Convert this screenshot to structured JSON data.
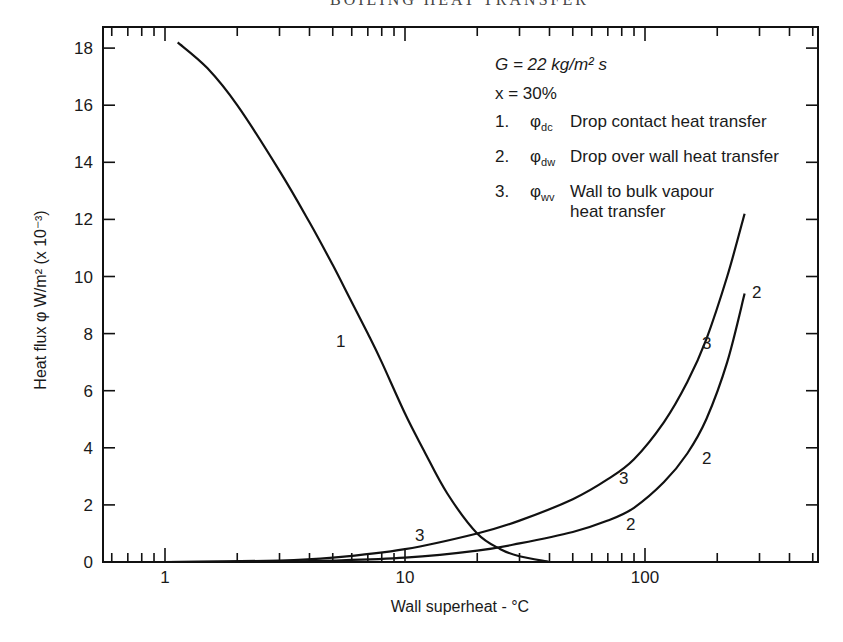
{
  "page": {
    "running_head": "BOILING HEAT TRANSFER"
  },
  "chart_data": {
    "type": "line",
    "title": "",
    "xlabel": "Wall superheat - °C",
    "ylabel": "Heat flux φ W/m² (x 10⁻³)",
    "xscale": "log",
    "xlim": [
      0.55,
      530
    ],
    "ylim": [
      0,
      19
    ],
    "x_ticks": [
      "1",
      "10",
      "100"
    ],
    "y_ticks": [
      "0",
      "2",
      "4",
      "6",
      "8",
      "10",
      "12",
      "14",
      "16",
      "18"
    ],
    "grid": false,
    "legend_position": "upper right (inside)",
    "annotations": {
      "line1": "G = 22 kg/m² s",
      "line2": "x = 30%",
      "items": [
        {
          "num": "1.",
          "symbol": "φ",
          "sub": "dc",
          "label": "Drop contact heat transfer"
        },
        {
          "num": "2.",
          "symbol": "φ",
          "sub": "dw",
          "label": "Drop over wall heat transfer"
        },
        {
          "num": "3.",
          "symbol": "φ",
          "sub": "wv",
          "label": "Wall to bulk vapour",
          "label2": "heat transfer"
        }
      ]
    },
    "series": [
      {
        "name": "1. φdc Drop contact heat transfer",
        "curve_label": "1",
        "x": [
          1.13,
          1.5,
          2,
          3,
          4,
          5,
          6,
          7,
          8,
          10,
          12,
          15,
          20,
          25,
          30,
          40
        ],
        "y": [
          18.2,
          17.3,
          16.0,
          13.7,
          11.9,
          10.4,
          9.1,
          8.0,
          7.0,
          5.2,
          3.9,
          2.4,
          1.0,
          0.45,
          0.2,
          0.0
        ]
      },
      {
        "name": "2. φdw Drop over wall heat transfer",
        "curve_label": "2",
        "x": [
          1,
          3,
          5,
          10,
          20,
          30,
          50,
          70,
          90,
          120,
          150,
          180,
          220,
          260
        ],
        "y": [
          0.0,
          0.02,
          0.05,
          0.15,
          0.4,
          0.65,
          1.05,
          1.45,
          1.9,
          2.8,
          3.8,
          5.0,
          7.0,
          9.4
        ]
      },
      {
        "name": "3. φwv Wall to bulk vapour heat transfer",
        "curve_label": "3",
        "x": [
          1,
          3,
          5,
          10,
          20,
          30,
          50,
          70,
          90,
          120,
          150,
          180,
          220,
          260
        ],
        "y": [
          0.0,
          0.05,
          0.15,
          0.45,
          1.0,
          1.45,
          2.2,
          2.9,
          3.6,
          4.9,
          6.3,
          7.8,
          10.0,
          12.2
        ]
      }
    ]
  }
}
